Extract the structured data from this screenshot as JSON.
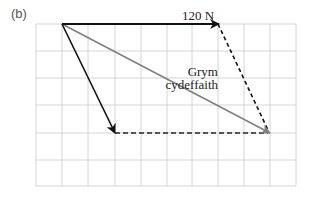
{
  "figure": {
    "panel_label": "(b)",
    "grid": {
      "x0": 36,
      "y0": 24,
      "cols": 10,
      "rows": 6,
      "cell_w": 26,
      "cell_h": 27,
      "color": "#d4d4d4"
    },
    "vectors": [
      {
        "name": "force-120N",
        "from": [
          62,
          24
        ],
        "to": [
          218,
          24
        ],
        "style": "solid",
        "color": "#111111",
        "label": "120 N"
      },
      {
        "name": "force-second",
        "from": [
          62,
          24
        ],
        "to": [
          115,
          133
        ],
        "style": "solid",
        "color": "#111111",
        "label": ""
      },
      {
        "name": "resultant-force",
        "from": [
          62,
          24
        ],
        "to": [
          270,
          133
        ],
        "style": "solid",
        "color": "#808080",
        "label": "Grym cydeffaith"
      }
    ],
    "construction_lines": [
      {
        "from": [
          218,
          24
        ],
        "to": [
          270,
          133
        ],
        "style": "dashed",
        "color": "#111111"
      },
      {
        "from": [
          115,
          133
        ],
        "to": [
          270,
          133
        ],
        "style": "dashed",
        "color": "#555555"
      }
    ],
    "labels": {
      "force_label": "120 N",
      "resultant_line1": "Grym",
      "resultant_line2": "cydeffaith"
    }
  }
}
